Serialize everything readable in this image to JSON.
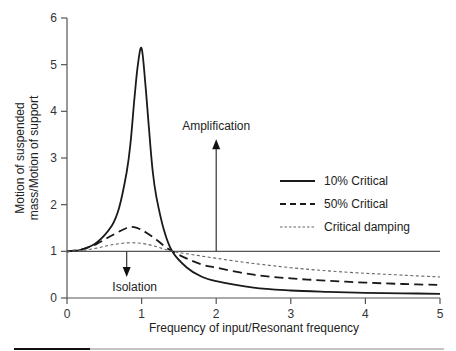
{
  "chart_data": {
    "type": "line",
    "title": "",
    "xlabel": "Frequency of input/Resonant frequency",
    "ylabel_line1": "Motion of suspended",
    "ylabel_line2": "mass/Motion of support",
    "xlim": [
      0,
      5
    ],
    "ylim": [
      0,
      6
    ],
    "x_ticks": [
      "0",
      "1",
      "2",
      "3",
      "4",
      "5"
    ],
    "y_ticks": [
      "0",
      "1",
      "2",
      "3",
      "4",
      "5",
      "6"
    ],
    "grid": false,
    "legend_position": "right-middle",
    "reference_line": {
      "y": 1,
      "x_range": [
        0,
        5
      ]
    },
    "annotations": [
      {
        "text": "Amplification",
        "arrow": "up",
        "x": 2,
        "y_from": 1,
        "y_to": 3.4
      },
      {
        "text": "Isolation",
        "arrow": "down",
        "x": 0.8,
        "y_from": 1,
        "y_to": 0.45
      }
    ],
    "series": [
      {
        "name": "10% Critical",
        "style": "solid",
        "x": [
          0,
          0.2,
          0.4,
          0.6,
          0.7,
          0.8,
          0.85,
          0.9,
          0.95,
          1.0,
          1.05,
          1.1,
          1.15,
          1.2,
          1.3,
          1.41,
          1.6,
          1.8,
          2.0,
          2.5,
          3.0,
          3.5,
          4.0,
          4.5,
          5.0
        ],
        "values": [
          1.0,
          1.04,
          1.19,
          1.55,
          1.94,
          2.7,
          3.3,
          4.2,
          5.0,
          5.35,
          4.6,
          3.6,
          2.7,
          2.15,
          1.45,
          1.0,
          0.66,
          0.46,
          0.36,
          0.22,
          0.16,
          0.13,
          0.11,
          0.1,
          0.09
        ]
      },
      {
        "name": "50% Critical",
        "style": "dashed",
        "x": [
          0,
          0.2,
          0.4,
          0.6,
          0.8,
          0.9,
          1.0,
          1.1,
          1.2,
          1.3,
          1.41,
          1.6,
          1.8,
          2.0,
          2.5,
          3.0,
          3.5,
          4.0,
          4.5,
          5.0
        ],
        "values": [
          1.0,
          1.04,
          1.16,
          1.34,
          1.5,
          1.52,
          1.46,
          1.36,
          1.25,
          1.12,
          1.0,
          0.85,
          0.72,
          0.65,
          0.5,
          0.42,
          0.37,
          0.33,
          0.3,
          0.28
        ]
      },
      {
        "name": "Critical damping",
        "style": "dotted",
        "x": [
          0,
          0.2,
          0.4,
          0.6,
          0.8,
          1.0,
          1.2,
          1.41,
          1.6,
          2.0,
          2.5,
          3.0,
          3.5,
          4.0,
          4.5,
          5.0
        ],
        "values": [
          1.0,
          1.02,
          1.07,
          1.14,
          1.18,
          1.17,
          1.1,
          1.0,
          0.95,
          0.85,
          0.74,
          0.65,
          0.58,
          0.53,
          0.49,
          0.45
        ]
      }
    ]
  },
  "legend": [
    {
      "label": "10% Critical",
      "style": "solid"
    },
    {
      "label": "50% Critical",
      "style": "dashed"
    },
    {
      "label": "Critical damping",
      "style": "dotted"
    }
  ],
  "colors": {
    "axis": "#555555",
    "line": "#1a1a1a",
    "dotted": "#666666",
    "rule_dark": "#111111",
    "rule_light": "#888888"
  }
}
